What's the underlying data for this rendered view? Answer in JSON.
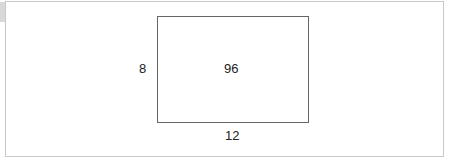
{
  "diagram": {
    "type": "rectangle-area",
    "height_label": "8",
    "width_label": "12",
    "area_label": "96",
    "colors": {
      "frame_border": "#c8c8c8",
      "rect_border": "#666666",
      "text": "#222222"
    }
  }
}
